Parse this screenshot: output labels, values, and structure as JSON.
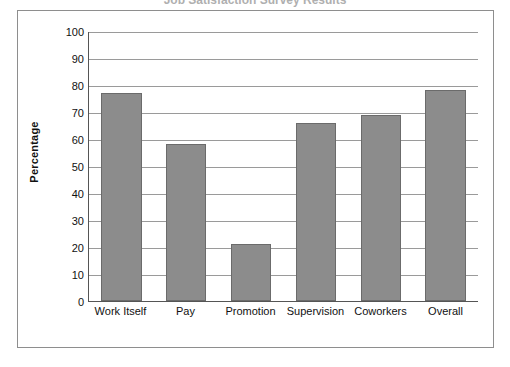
{
  "figure": {
    "title_cropped": "Job Satisfaction Survey Results",
    "frame_color": "#8e8e8e",
    "background": "#ffffff"
  },
  "chart_data": {
    "type": "bar",
    "title": "",
    "xlabel": "",
    "ylabel": "Percentage",
    "ylim": [
      0,
      100
    ],
    "ytick_step": 10,
    "yticks": [
      100,
      90,
      80,
      70,
      60,
      50,
      40,
      30,
      20,
      10,
      0
    ],
    "grid": true,
    "legend": false,
    "bar_color": "#8c8c8c",
    "bar_edge_color": "#6b6b6b",
    "categories": [
      "Work Itself",
      "Pay",
      "Promotion",
      "Supervision",
      "Coworkers",
      "Overall"
    ],
    "values": [
      77,
      58,
      21,
      66,
      69,
      78
    ],
    "series": [
      {
        "name": "Percentage satisfied",
        "values": [
          77,
          58,
          21,
          66,
          69,
          78
        ]
      }
    ]
  }
}
